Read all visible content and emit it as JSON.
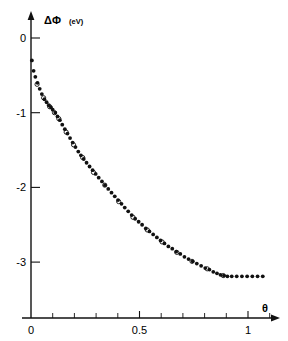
{
  "figure": {
    "name": "work-function-change-vs-coverage-plot",
    "background": "#ffffff",
    "ink_color": "#111111"
  },
  "axes": {
    "y_label_symbol": "ΔΦ",
    "y_label_unit": "(eV)",
    "x_label_symbol": "θ",
    "y_ticklabels": [
      "0",
      "-1",
      "-2",
      "-3"
    ],
    "y_tickvalues": [
      0,
      -1,
      -2,
      -3
    ],
    "x_ticklabels": [
      "0",
      "0.5",
      "1"
    ],
    "x_tickvalues": [
      0,
      0.5,
      1
    ]
  },
  "chart_data": {
    "type": "scatter",
    "title": "",
    "xlabel": "θ",
    "ylabel": "ΔΦ (eV)",
    "xlim": [
      -0.02,
      1.12
    ],
    "ylim": [
      -3.55,
      0.28
    ],
    "grid": false,
    "legend_position": "none",
    "x_major_ticks": [
      0,
      0.5,
      1
    ],
    "x_minor_tick_step": 0.1,
    "y_major_ticks": [
      0,
      -1,
      -2,
      -3
    ],
    "series": [
      {
        "name": "filled-circles",
        "marker": "filled-circle",
        "color": "#111111",
        "points": [
          [
            0.004,
            -0.3
          ],
          [
            0.012,
            -0.44
          ],
          [
            0.02,
            -0.52
          ],
          [
            0.03,
            -0.6
          ],
          [
            0.04,
            -0.68
          ],
          [
            0.05,
            -0.75
          ],
          [
            0.062,
            -0.82
          ],
          [
            0.072,
            -0.86
          ],
          [
            0.082,
            -0.9
          ],
          [
            0.092,
            -0.93
          ],
          [
            0.1,
            -0.96
          ],
          [
            0.112,
            -1.0
          ],
          [
            0.122,
            -1.05
          ],
          [
            0.133,
            -1.1
          ],
          [
            0.144,
            -1.16
          ],
          [
            0.156,
            -1.22
          ],
          [
            0.168,
            -1.28
          ],
          [
            0.18,
            -1.34
          ],
          [
            0.192,
            -1.4
          ],
          [
            0.205,
            -1.46
          ],
          [
            0.218,
            -1.52
          ],
          [
            0.23,
            -1.57
          ],
          [
            0.243,
            -1.62
          ],
          [
            0.256,
            -1.67
          ],
          [
            0.27,
            -1.72
          ],
          [
            0.284,
            -1.77
          ],
          [
            0.298,
            -1.82
          ],
          [
            0.312,
            -1.87
          ],
          [
            0.327,
            -1.92
          ],
          [
            0.341,
            -1.97
          ],
          [
            0.356,
            -2.02
          ],
          [
            0.371,
            -2.07
          ],
          [
            0.386,
            -2.12
          ],
          [
            0.401,
            -2.17
          ],
          [
            0.417,
            -2.22
          ],
          [
            0.432,
            -2.27
          ],
          [
            0.448,
            -2.32
          ],
          [
            0.464,
            -2.37
          ],
          [
            0.48,
            -2.42
          ],
          [
            0.496,
            -2.46
          ],
          [
            0.512,
            -2.5
          ],
          [
            0.529,
            -2.55
          ],
          [
            0.546,
            -2.59
          ],
          [
            0.563,
            -2.63
          ],
          [
            0.58,
            -2.67
          ],
          [
            0.597,
            -2.71
          ],
          [
            0.615,
            -2.75
          ],
          [
            0.633,
            -2.79
          ],
          [
            0.651,
            -2.82
          ],
          [
            0.669,
            -2.86
          ],
          [
            0.688,
            -2.89
          ],
          [
            0.707,
            -2.93
          ],
          [
            0.726,
            -2.96
          ],
          [
            0.745,
            -2.99
          ],
          [
            0.764,
            -3.02
          ],
          [
            0.784,
            -3.05
          ],
          [
            0.803,
            -3.08
          ],
          [
            0.822,
            -3.1
          ],
          [
            0.84,
            -3.13
          ],
          [
            0.857,
            -3.15
          ],
          [
            0.873,
            -3.17
          ],
          [
            0.889,
            -3.18
          ],
          [
            0.905,
            -3.19
          ],
          [
            0.925,
            -3.19
          ],
          [
            0.948,
            -3.19
          ],
          [
            0.972,
            -3.19
          ],
          [
            0.996,
            -3.19
          ],
          [
            1.02,
            -3.19
          ],
          [
            1.044,
            -3.19
          ],
          [
            1.068,
            -3.19
          ]
        ]
      },
      {
        "name": "open-circles",
        "marker": "open-circle",
        "color": "#111111",
        "points": [
          [
            0.028,
            -0.62
          ],
          [
            0.058,
            -0.8
          ],
          [
            0.086,
            -0.92
          ],
          [
            0.108,
            -1.0
          ],
          [
            0.128,
            -1.08
          ],
          [
            0.162,
            -1.26
          ],
          [
            0.196,
            -1.43
          ],
          [
            0.238,
            -1.6
          ],
          [
            0.288,
            -1.8
          ],
          [
            0.34,
            -1.97
          ],
          [
            0.404,
            -2.19
          ],
          [
            0.47,
            -2.4
          ],
          [
            0.536,
            -2.57
          ],
          [
            0.604,
            -2.73
          ],
          [
            0.672,
            -2.87
          ],
          [
            0.742,
            -2.99
          ],
          [
            0.812,
            -3.09
          ],
          [
            0.886,
            -3.18
          ]
        ]
      }
    ]
  }
}
